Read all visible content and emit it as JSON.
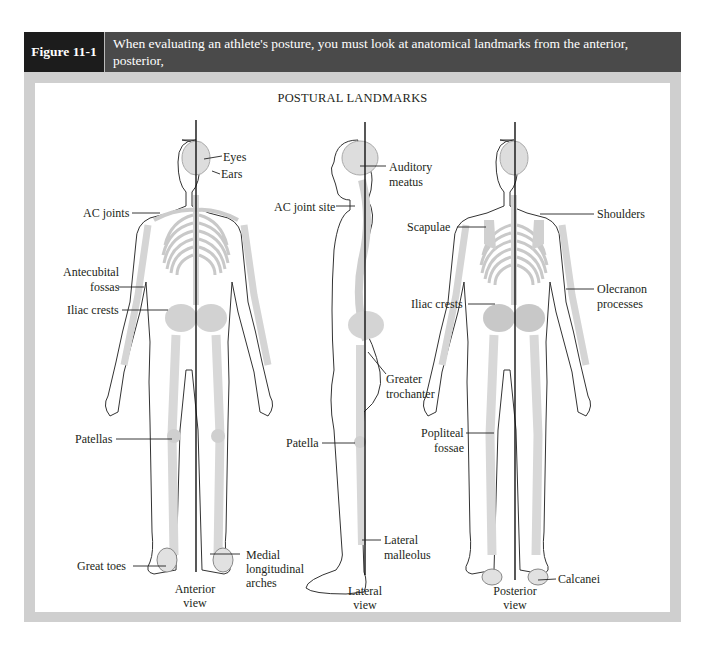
{
  "header": {
    "figure_label": "Figure 11-1",
    "caption_line1": "When evaluating an athlete's posture, you must look at anatomical landmarks from the anterior, posterior,",
    "caption_line2": "and lateral views."
  },
  "diagram": {
    "title": "POSTURAL LANDMARKS",
    "anterior": {
      "view_label_1": "Anterior",
      "view_label_2": "view",
      "labels": {
        "eyes": "Eyes",
        "ears": "Ears",
        "ac_joints": "AC joints",
        "antecubital_1": "Antecubital",
        "antecubital_2": "fossas",
        "iliac_crests": "Iliac crests",
        "patellas": "Patellas",
        "great_toes": "Great toes",
        "medial_1": "Medial",
        "medial_2": "longitudinal",
        "medial_3": "arches"
      }
    },
    "lateral": {
      "view_label_1": "Lateral",
      "view_label_2": "view",
      "labels": {
        "auditory_1": "Auditory",
        "auditory_2": "meatus",
        "ac_joint_site": "AC joint site",
        "greater_1": "Greater",
        "greater_2": "trochanter",
        "patella": "Patella",
        "malleolus_1": "Lateral",
        "malleolus_2": "malleolus"
      }
    },
    "posterior": {
      "view_label_1": "Posterior",
      "view_label_2": "view",
      "labels": {
        "scapulae": "Scapulae",
        "shoulders": "Shoulders",
        "iliac_crests": "Iliac crests",
        "olecranon_1": "Olecranon",
        "olecranon_2": "processes",
        "popliteal_1": "Popliteal",
        "popliteal_2": "fossae",
        "calcanei": "Calcanei"
      }
    }
  }
}
